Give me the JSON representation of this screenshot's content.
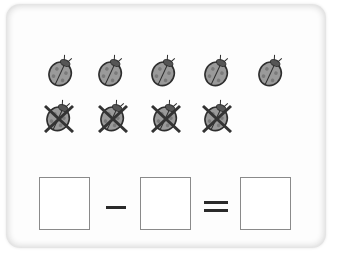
{
  "worksheet": {
    "type": "subtraction-picture-exercise",
    "total_items": 9,
    "crossed_out_items": 4,
    "remaining_items": 5,
    "item_icon": "ladybug-icon",
    "row1": [
      {
        "x": 46,
        "y": 54,
        "crossed": false
      },
      {
        "x": 96,
        "y": 54,
        "crossed": false
      },
      {
        "x": 149,
        "y": 54,
        "crossed": false
      },
      {
        "x": 202,
        "y": 54,
        "crossed": false
      },
      {
        "x": 256,
        "y": 54,
        "crossed": false
      }
    ],
    "row2": [
      {
        "x": 44,
        "y": 99,
        "crossed": true
      },
      {
        "x": 98,
        "y": 99,
        "crossed": true
      },
      {
        "x": 151,
        "y": 99,
        "crossed": true
      },
      {
        "x": 202,
        "y": 99,
        "crossed": true
      }
    ],
    "equation": {
      "box1": "",
      "operator": "−",
      "box2": "",
      "equals": "=",
      "box3": ""
    },
    "colors": {
      "bug_fill": "#9a9a9a",
      "bug_outline": "#2e2e2e",
      "cross": "#333333",
      "box_border": "#8a8a8a"
    }
  }
}
